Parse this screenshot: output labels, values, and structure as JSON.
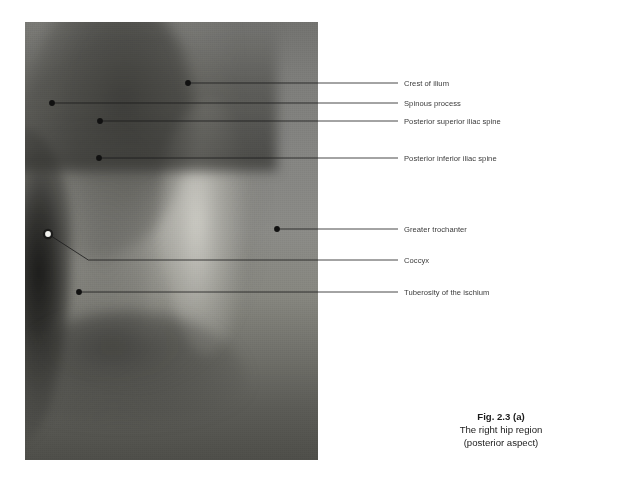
{
  "figure": {
    "photo_alt": "photograph-of-right-hip-region-posterior-aspect"
  },
  "annotations": [
    {
      "id": "crest-of-ilium",
      "label": "Crest of ilium",
      "marker": {
        "x": 188,
        "y": 83,
        "color": "#111111",
        "style": "filled"
      },
      "line_y": 83,
      "line_end_x": 398,
      "label_y": 79
    },
    {
      "id": "spinous-process",
      "label": "Spinous process",
      "marker": {
        "x": 52,
        "y": 103,
        "color": "#111111",
        "style": "filled"
      },
      "line_y": 103,
      "line_end_x": 398,
      "label_y": 99
    },
    {
      "id": "posterior-superior-iliac-spine",
      "label": "Posterior superior iliac spine",
      "marker": {
        "x": 100,
        "y": 121,
        "color": "#111111",
        "style": "filled"
      },
      "line_y": 121,
      "line_end_x": 398,
      "label_y": 117
    },
    {
      "id": "posterior-inferior-iliac-spine",
      "label": "Posterior inferior iliac spine",
      "marker": {
        "x": 99,
        "y": 158,
        "color": "#111111",
        "style": "filled"
      },
      "line_y": 158,
      "line_end_x": 398,
      "label_y": 154
    },
    {
      "id": "greater-trochanter",
      "label": "Greater trochanter",
      "marker": {
        "x": 277,
        "y": 229,
        "color": "#111111",
        "style": "filled"
      },
      "line_y": 229,
      "line_end_x": 398,
      "label_y": 225
    },
    {
      "id": "coccyx",
      "label": "Coccyx",
      "marker": {
        "x": 48,
        "y": 234,
        "color": "#f2f2ee",
        "style": "open"
      },
      "line_y": 260,
      "line_end_x": 398,
      "label_y": 256
    },
    {
      "id": "tuberosity-of-the-ischium",
      "label": "Tuberosity of the ischium",
      "marker": {
        "x": 79,
        "y": 292,
        "color": "#111111",
        "style": "filled"
      },
      "line_y": 292,
      "line_end_x": 398,
      "label_y": 288
    }
  ],
  "caption": {
    "title": "Fig. 2.3 (a)",
    "line1": "The right hip region",
    "line2": "(posterior aspect)"
  },
  "colors": {
    "leader_line": "#1a1a1a",
    "label_text": "#3a3a3a",
    "caption_text": "#1b1b1b",
    "page_background": "#ffffff"
  }
}
